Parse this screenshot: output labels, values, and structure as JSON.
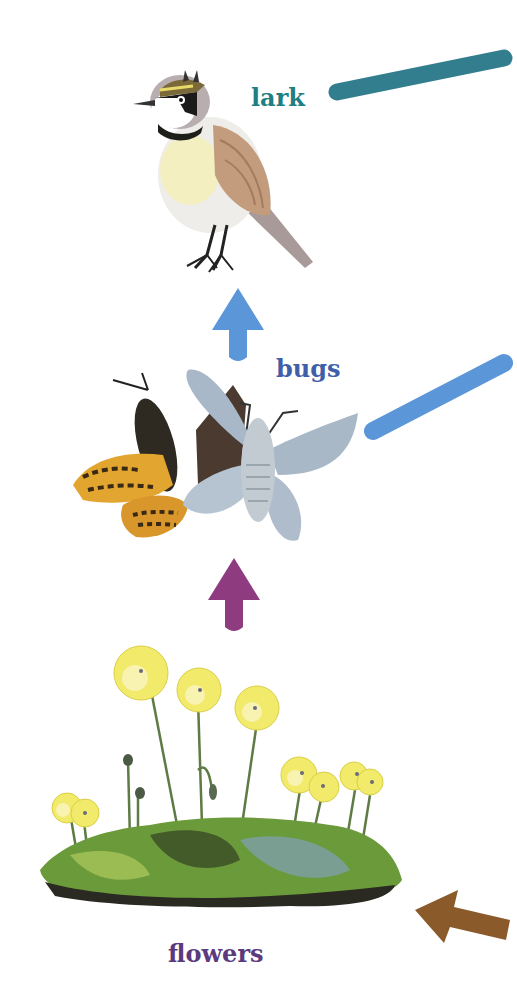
{
  "diagram": {
    "type": "food-chain",
    "nodes": [
      {
        "id": "lark",
        "label": "lark",
        "color": "#1f7f83",
        "icon": "lark-bird-icon"
      },
      {
        "id": "bugs",
        "label": "bugs",
        "color": "#3f5fa8",
        "icon": "butterfly-moth-icon"
      },
      {
        "id": "flowers",
        "label": "flowers",
        "color": "#5b3a7e",
        "icon": "arctic-poppy-moss-icon"
      }
    ],
    "arrows": [
      {
        "from": "flowers",
        "to": "bugs",
        "color": "#8e3b80",
        "direction": "up"
      },
      {
        "from": "bugs",
        "to": "lark",
        "color": "#5b96d8",
        "direction": "up"
      }
    ],
    "offscreen_connectors": [
      {
        "from": "lark",
        "color": "#327d8e",
        "direction": "right"
      },
      {
        "from": "bugs",
        "color": "#5b96d8",
        "direction": "right"
      },
      {
        "to": "flowers",
        "color": "#8b5a2b",
        "direction": "left-arrow"
      }
    ]
  }
}
